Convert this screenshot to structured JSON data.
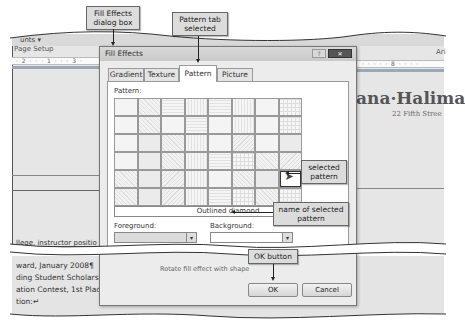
{
  "background_app": {
    "ribbon_fragment_left": "unts ▾",
    "group_label": "Page Setup",
    "ruler_left": "· 2 · · · 1 · · · 3 ·",
    "ruler_right": "· · · · · 8 · · · ·",
    "font_fragment": "Ari",
    "document": {
      "name_fragment": "ana·Halima",
      "address_fragment": "22 Fifth Stree",
      "line_fragment": "llege, instructor positio",
      "bottom_lines": [
        "ward, January 2008¶",
        "ding Student Scholarshi",
        "ation Contest, 1st Place,",
        "tion:↵"
      ]
    }
  },
  "dialog": {
    "title": "Fill Effects",
    "help_icon": "?",
    "close_icon": "✕",
    "tabs": [
      {
        "label": "Gradient",
        "active": false
      },
      {
        "label": "Texture",
        "active": false
      },
      {
        "label": "Pattern",
        "active": true
      },
      {
        "label": "Picture",
        "active": false
      }
    ],
    "pattern_label": "Pattern:",
    "pattern_grid": {
      "rows": 6,
      "columns": 8,
      "selected": {
        "row": 5,
        "column": 8
      }
    },
    "selected_pattern_name": "Outlined diamond",
    "foreground_label": "Foreground:",
    "background_label": "Background:",
    "rotate_option": "Rotate fill effect with shape",
    "ok_label": "OK",
    "cancel_label": "Cancel"
  },
  "callouts": {
    "dialog_box": "Fill Effects dialog box",
    "pattern_tab": "Pattern tab selected",
    "selected_pattern": "selected pattern",
    "pattern_name": "name of selected pattern",
    "ok_button": "OK button"
  }
}
